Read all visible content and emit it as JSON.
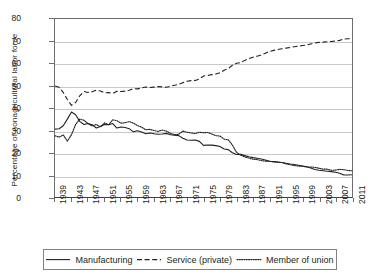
{
  "chart_data": {
    "type": "line",
    "title": "",
    "xlabel": "",
    "ylabel": "Percentage of nonagricultural labor force",
    "xlim": [
      1939,
      2011
    ],
    "ylim": [
      0,
      80
    ],
    "ytick_step": 10,
    "xtick_step": 4,
    "grid": true,
    "legend_position": "bottom",
    "ytick_labels": [
      "0",
      "10",
      "20",
      "30",
      "40",
      "50",
      "60",
      "70",
      "80"
    ],
    "xtick_labels": [
      "1939",
      "1943",
      "1947",
      "1951",
      "1955",
      "1959",
      "1963",
      "1967",
      "1971",
      "1975",
      "1979",
      "1983",
      "1987",
      "1991",
      "1995",
      "1999",
      "2003",
      "2007",
      "2011"
    ],
    "x": [
      1939,
      1940,
      1941,
      1942,
      1943,
      1944,
      1945,
      1946,
      1947,
      1948,
      1949,
      1950,
      1951,
      1952,
      1953,
      1954,
      1955,
      1956,
      1957,
      1958,
      1959,
      1960,
      1961,
      1962,
      1963,
      1964,
      1965,
      1966,
      1967,
      1968,
      1969,
      1970,
      1971,
      1972,
      1973,
      1974,
      1975,
      1976,
      1977,
      1978,
      1979,
      1980,
      1981,
      1982,
      1983,
      1984,
      1985,
      1986,
      1987,
      1988,
      1989,
      1990,
      1991,
      1992,
      1993,
      1994,
      1995,
      1996,
      1997,
      1998,
      1999,
      2000,
      2001,
      2002,
      2003,
      2004,
      2005,
      2006,
      2007,
      2008,
      2009,
      2010,
      2011
    ],
    "series": [
      {
        "name": "Manufacturing",
        "style": "solid",
        "color": "#231f20",
        "values": [
          30.5,
          30.7,
          32.0,
          35.0,
          38.2,
          37.0,
          34.0,
          32.6,
          33.0,
          32.5,
          31.0,
          31.7,
          32.6,
          32.5,
          33.0,
          31.0,
          31.5,
          31.2,
          30.7,
          29.3,
          29.8,
          29.2,
          28.4,
          28.8,
          28.4,
          28.2,
          28.3,
          28.6,
          28.0,
          27.8,
          27.6,
          26.4,
          25.6,
          25.5,
          25.6,
          25.0,
          23.2,
          23.4,
          23.3,
          23.1,
          22.7,
          21.6,
          21.3,
          19.9,
          19.1,
          19.2,
          18.6,
          18.1,
          17.7,
          17.4,
          17.1,
          16.6,
          16.1,
          15.9,
          15.6,
          15.5,
          15.2,
          14.8,
          14.6,
          14.3,
          13.9,
          13.6,
          13.0,
          12.4,
          12.0,
          11.8,
          11.6,
          11.4,
          11.1,
          10.7,
          9.9,
          9.9,
          10.0
        ]
      },
      {
        "name": "Service (private)",
        "style": "dashed",
        "color": "#231f20",
        "values": [
          49.9,
          49.3,
          47.0,
          43.8,
          41.2,
          42.5,
          45.5,
          47.4,
          47.0,
          47.3,
          48.0,
          47.6,
          46.8,
          46.9,
          46.5,
          47.5,
          47.4,
          47.6,
          48.0,
          48.7,
          48.6,
          49.0,
          49.4,
          49.2,
          49.4,
          49.6,
          49.5,
          49.3,
          49.8,
          50.2,
          50.6,
          51.4,
          52.0,
          52.3,
          52.4,
          53.0,
          54.4,
          54.6,
          55.0,
          55.3,
          55.8,
          57.0,
          57.7,
          59.2,
          60.1,
          60.4,
          61.4,
          62.2,
          62.8,
          63.3,
          63.8,
          64.6,
          65.4,
          65.9,
          66.3,
          66.6,
          66.9,
          67.2,
          67.5,
          67.8,
          68.1,
          68.3,
          68.8,
          69.2,
          69.5,
          69.6,
          69.8,
          69.9,
          70.1,
          70.4,
          71.0,
          71.1,
          71.2
        ]
      },
      {
        "name": "Member of union",
        "style": "dotted",
        "color": "#231f20",
        "values": [
          27.5,
          26.9,
          27.9,
          25.1,
          28.0,
          32.6,
          35.0,
          34.5,
          33.0,
          31.9,
          32.6,
          31.5,
          33.3,
          32.5,
          34.7,
          34.3,
          33.2,
          33.4,
          33.9,
          33.2,
          32.1,
          31.4,
          30.2,
          30.4,
          29.9,
          29.5,
          30.1,
          29.6,
          28.6,
          28.0,
          28.2,
          29.6,
          29.1,
          28.8,
          28.5,
          29.1,
          28.9,
          29.0,
          28.3,
          27.6,
          27.4,
          26.0,
          25.7,
          23.4,
          20.1,
          18.8,
          18.0,
          17.5,
          17.0,
          16.8,
          16.4,
          16.1,
          16.1,
          15.8,
          15.8,
          15.5,
          14.9,
          14.5,
          14.1,
          13.9,
          13.9,
          13.5,
          13.5,
          13.3,
          12.9,
          12.5,
          12.5,
          12.0,
          12.1,
          12.4,
          12.3,
          11.9,
          11.8
        ]
      }
    ]
  },
  "legend": {
    "items": [
      {
        "label": "Manufacturing",
        "style": "solid"
      },
      {
        "label": "Service (private)",
        "style": "dashed"
      },
      {
        "label": "Member of union",
        "style": "dotted"
      }
    ]
  },
  "colors": {
    "ink": "#231f20",
    "axis": "#6d6e71",
    "grid": "#c9cacc",
    "background": "#ffffff"
  }
}
